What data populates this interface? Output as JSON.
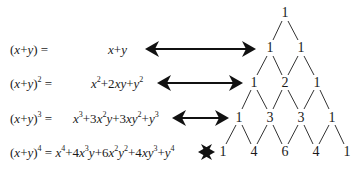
{
  "rows": [
    {
      "lhs_base": "(x+y)",
      "lhs_exp": "",
      "eq": "=",
      "rhs": "x+y"
    },
    {
      "lhs_base": "(x+y)",
      "lhs_exp": "2",
      "eq": "=",
      "rhs": "x²+2xy+y²"
    },
    {
      "lhs_base": "(x+y)",
      "lhs_exp": "3",
      "eq": "=",
      "rhs": "x³+3x²y+3xy²+y³"
    },
    {
      "lhs_base": "(x+y)",
      "lhs_exp": "4",
      "eq": "=",
      "rhs": "x⁴+4x³y+6x²y²+4xy³+y⁴"
    }
  ],
  "triangle": [
    [
      "1"
    ],
    [
      "1",
      "1"
    ],
    [
      "1",
      "2",
      "1"
    ],
    [
      "1",
      "3",
      "3",
      "1"
    ],
    [
      "1",
      "4",
      "6",
      "4",
      "1"
    ]
  ],
  "icons": {
    "arrow": "double-headed-arrow-icon"
  }
}
